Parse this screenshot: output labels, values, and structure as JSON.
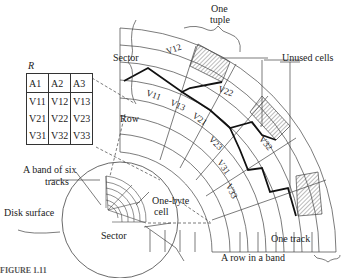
{
  "relation": {
    "name": "R",
    "headers": [
      "A1",
      "A2",
      "A3"
    ],
    "rows": [
      [
        "V11",
        "V12",
        "V13"
      ],
      [
        "V21",
        "V22",
        "V23"
      ],
      [
        "V31",
        "V32",
        "V33"
      ]
    ]
  },
  "labels": {
    "one_tuple": "One\ntuple",
    "one_tuple_l1": "One",
    "one_tuple_l2": "tuple",
    "sector_top": "Sector",
    "unused_cells": "Unused cells",
    "row": "Row",
    "band_l1": "A band of six",
    "band_l2": "tracks",
    "one_byte_l1": "One-byte",
    "one_byte_l2": "cell",
    "disk_surface": "Disk surface",
    "sector_bottom": "Sector",
    "one_track": "One track",
    "row_in_band": "A  row in a band",
    "figure_caption": "FIGURE 1.11"
  },
  "fan_cells": [
    {
      "id": "V12",
      "label": "V12"
    },
    {
      "id": "V11",
      "label": "V11"
    },
    {
      "id": "V13",
      "label": "V13"
    },
    {
      "id": "V22",
      "label": "V22"
    },
    {
      "id": "V21",
      "label": "V21"
    },
    {
      "id": "V23",
      "label": "V23"
    },
    {
      "id": "V32",
      "label": "V32"
    },
    {
      "id": "V31",
      "label": "V31"
    },
    {
      "id": "V33",
      "label": "V33"
    }
  ]
}
